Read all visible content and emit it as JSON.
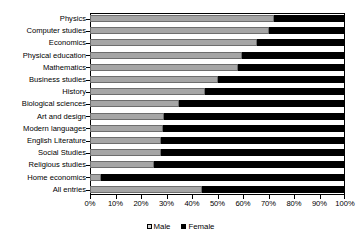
{
  "chart_data": {
    "type": "bar",
    "orientation": "horizontal",
    "stacked": true,
    "stack_total": 100,
    "title": "",
    "subtitle": "",
    "xlabel": "",
    "ylabel": "",
    "xlim": [
      0,
      100
    ],
    "xticks": [
      0,
      10,
      20,
      30,
      40,
      50,
      60,
      70,
      80,
      90,
      100
    ],
    "xtick_labels": [
      "0%",
      "10%",
      "20%",
      "30%",
      "40%",
      "50%",
      "60%",
      "70%",
      "80%",
      "90%",
      "100%"
    ],
    "grid": false,
    "legend_position": "bottom-center",
    "categories": [
      "Physics",
      "Computer studies",
      "Economics",
      "Physical education",
      "Mathematics",
      "Business studies",
      "History",
      "Biological sciences",
      "Art and design",
      "Modern languages",
      "English Literature",
      "Social Studies",
      "Religious studies",
      "Home economics",
      "All entries"
    ],
    "series": [
      {
        "name": "Male",
        "color": "#a6a6a6",
        "values": [
          72,
          70,
          65.5,
          59.5,
          58,
          50,
          45,
          35,
          29,
          28.5,
          28,
          28,
          25,
          4.5,
          44
        ]
      },
      {
        "name": "Female",
        "color": "#000000",
        "values": [
          28,
          30,
          34.5,
          40.5,
          42,
          50,
          55,
          65,
          71,
          71.5,
          72,
          72,
          75,
          95.5,
          56
        ]
      }
    ],
    "legend": [
      {
        "label": "Male",
        "color": "#a6a6a6"
      },
      {
        "label": "Female",
        "color": "#000000"
      }
    ]
  }
}
